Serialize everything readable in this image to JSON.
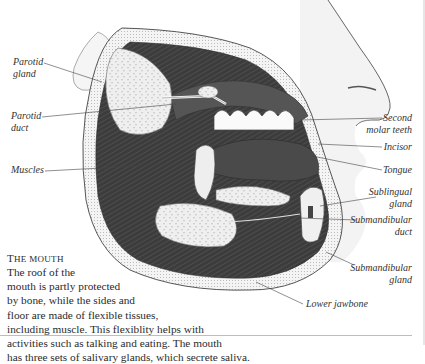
{
  "figure": {
    "colors": {
      "background": "#ffffff",
      "ink": "#2a2a2a",
      "muscle": "#3a3a3a",
      "gland": "#ececec",
      "skin": "#f2f2f2",
      "rule": "#bdbdbd"
    }
  },
  "labels": {
    "parotid_gland": "Parotid gland",
    "parotid_gland_l1": "Parotid",
    "parotid_gland_l2": "gland",
    "parotid_duct_l1": "Parotid",
    "parotid_duct_l2": "duct",
    "muscles": "Muscles",
    "second_molar_l1": "Second",
    "second_molar_l2": "molar teeth",
    "incisor": "Incisor",
    "tongue": "Tongue",
    "sublingual_l1": "Sublingual",
    "sublingual_l2": "gland",
    "submandibular_duct_l1": "Submandibular",
    "submandibular_duct_l2": "duct",
    "submandibular_gland_l1": "Submandibular",
    "submandibular_gland_l2": "gland",
    "lower_jawbone": "Lower jawbone"
  },
  "caption": {
    "title_first": "T",
    "title_rest": "he mouth",
    "lines": [
      "The roof of the",
      "mouth is partly protected",
      "by bone, while the sides and",
      "floor are made of flexible tissues,",
      "including muscle. This flexiblity helps with",
      "activities such as talking and eating. The mouth",
      "has three sets of salivary glands, which secrete saliva."
    ]
  }
}
